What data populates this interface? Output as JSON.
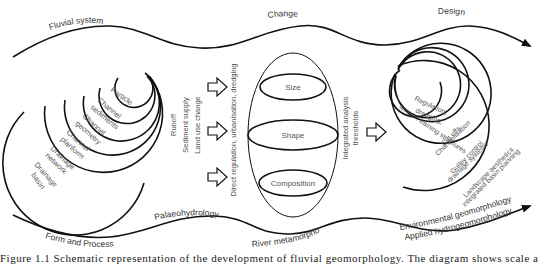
{
  "top_flow": {
    "labels": {
      "fluvial_system": "Fluvial system",
      "change": "Change",
      "design": "Design"
    }
  },
  "left_spiral": {
    "rings": [
      {
        "label_line1": "Particle",
        "label_line2": ""
      },
      {
        "label_line1": "Channel",
        "label_line2": "sediments"
      },
      {
        "label_line1": "Channel",
        "label_line2": "geometry"
      },
      {
        "label_line1": "Channel",
        "label_line2": "planform"
      },
      {
        "label_line1": "Drainage",
        "label_line2": "network"
      },
      {
        "label_line1": "Drainage",
        "label_line2": "basin"
      }
    ]
  },
  "drivers": {
    "runoff": "Runoff",
    "sediment_supply": "Sediment supply",
    "land_use_change": "Land use change",
    "direct": "Direct regulation, urbanisation, dredging"
  },
  "center_ellipse": {
    "sections": {
      "size": "Size",
      "shape": "Shape",
      "composition": "Composition"
    }
  },
  "analysis": {
    "line1": "Integrated analysis",
    "line2": "thresholds"
  },
  "right_spiral": {
    "rings": [
      {
        "label_line1": "Regulation,",
        "label_line2": "dredging,",
        "label_line3": "levees, training structures"
      },
      {
        "label_line1": "Cut offs",
        "label_line2": "Channelisation"
      },
      {
        "label_line1": "Gulley control",
        "label_line2": "drainage systems"
      },
      {
        "label_line1": "Landscape aesthetics",
        "label_line2": "integrated basin planning"
      }
    ]
  },
  "bottom_flow": {
    "labels": {
      "form_and_process": "Form and Process",
      "palaeohydrology": "Palaeohydrology",
      "river_metamorphosis": "River metamorphosis",
      "environmental_geomorphology": "Environmental geomorphology",
      "applied_hydrogeomorphology": "Applied hydrogeomorphology"
    }
  },
  "caption": {
    "partial_text": "Figure 1.1 Schematic representation of the development of fluvial geomorphology. The diagram shows scale and design"
  }
}
